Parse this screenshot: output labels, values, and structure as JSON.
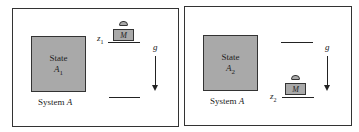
{
  "panels": [
    {
      "state_label": "State",
      "state_name": "A",
      "state_sub": "1",
      "system_label": "System",
      "system_name": "A",
      "height_label": "z",
      "height_sub": "1",
      "mass_label": "M",
      "gravity_label": "g",
      "mass_position": "top"
    },
    {
      "state_label": "State",
      "state_name": "A",
      "state_sub": "2",
      "system_label": "System",
      "system_name": "A",
      "height_label": "z",
      "height_sub": "2",
      "mass_label": "M",
      "gravity_label": "g",
      "mass_position": "bottom"
    }
  ],
  "colors": {
    "fill": "#a9a9a9",
    "stroke": "#222222",
    "background": "#ffffff"
  }
}
